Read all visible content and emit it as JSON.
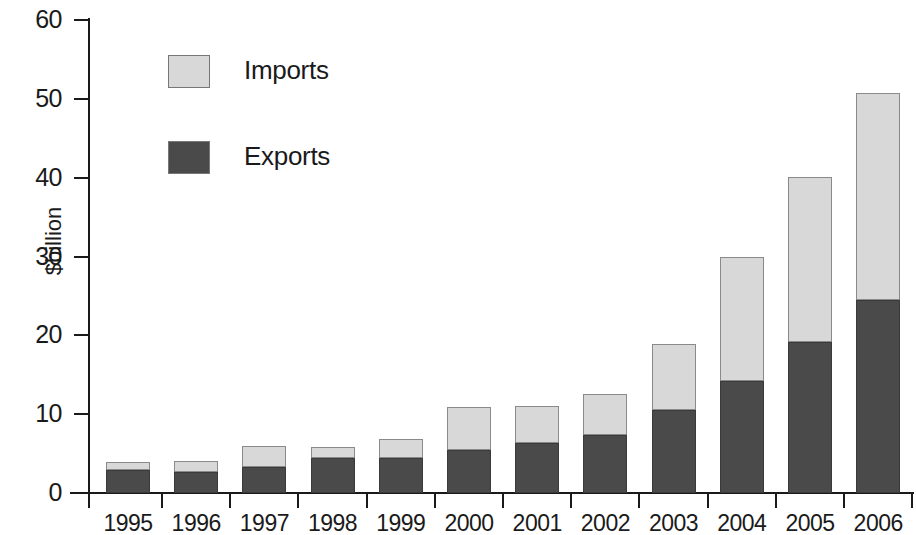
{
  "chart_data": {
    "type": "bar",
    "stacked": true,
    "title": "",
    "xlabel": "",
    "ylabel": "$billion",
    "ylim": [
      0,
      60
    ],
    "yticks": [
      0,
      10,
      20,
      30,
      40,
      50,
      60
    ],
    "grid": false,
    "legend_position": "upper-left-inside",
    "categories": [
      "1995",
      "1996",
      "1997",
      "1998",
      "1999",
      "2000",
      "2001",
      "2002",
      "2003",
      "2004",
      "2005",
      "2006"
    ],
    "series": [
      {
        "name": "Exports",
        "color": "#4a4a4a",
        "values": [
          2.9,
          2.7,
          3.3,
          4.5,
          4.5,
          5.4,
          6.4,
          7.3,
          10.5,
          14.2,
          19.2,
          24.5
        ]
      },
      {
        "name": "Imports",
        "color": "#d8d8d8",
        "values": [
          1.0,
          1.4,
          2.7,
          1.3,
          2.3,
          5.5,
          4.7,
          5.3,
          8.4,
          15.7,
          20.9,
          26.3
        ]
      }
    ],
    "totals": [
      3.9,
      4.1,
      6.0,
      5.8,
      6.8,
      10.9,
      11.1,
      12.6,
      18.9,
      29.9,
      40.1,
      50.8
    ]
  },
  "axes": {
    "y_title": "$billion",
    "y_tick_labels": [
      "0",
      "10",
      "20",
      "30",
      "40",
      "50",
      "60"
    ],
    "x_tick_labels": [
      "1995",
      "1996",
      "1997",
      "1998",
      "1999",
      "2000",
      "2001",
      "2002",
      "2003",
      "2004",
      "2005",
      "2006"
    ]
  },
  "legend": {
    "items": [
      {
        "label": "Imports",
        "color": "#d8d8d8"
      },
      {
        "label": "Exports",
        "color": "#4a4a4a"
      }
    ]
  },
  "colors": {
    "imports": "#d8d8d8",
    "exports": "#4a4a4a",
    "axis": "#1a1a1a",
    "background": "#ffffff"
  }
}
